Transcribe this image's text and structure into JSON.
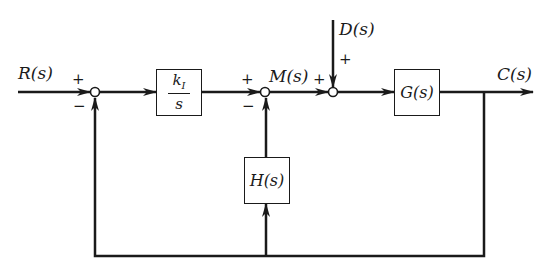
{
  "diagram": {
    "type": "feedback-control-block-diagram",
    "colors": {
      "line": "#1a1a1a",
      "background": "#ffffff"
    },
    "signals": {
      "input": "R(s)",
      "disturbance": "D(s)",
      "intermediate": "M(s)",
      "output": "C(s)"
    },
    "blocks": {
      "controller": {
        "numerator": "k",
        "numerator_sub": "I",
        "denominator": "s"
      },
      "plant": {
        "label": "G(s)"
      },
      "inner_feedback": {
        "label": "H(s)"
      }
    },
    "junctions": {
      "j1": {
        "top_sign": "+",
        "bottom_sign": "−"
      },
      "j2": {
        "top_sign": "+",
        "bottom_sign": "−"
      },
      "j3": {
        "left_sign": "+",
        "top_sign": "+"
      }
    }
  }
}
